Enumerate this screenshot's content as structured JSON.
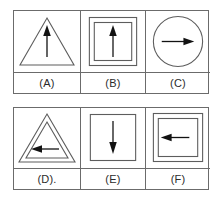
{
  "figure": {
    "title": "",
    "colors": {
      "background": "#ffffff",
      "outline": "#5d5d5d",
      "panel_border": "#6b6b6b",
      "arrow": "#121212",
      "label_text": "#2b2b2b"
    },
    "rows": [
      {
        "row_name": "top-row",
        "cells": [
          {
            "label": "(A)",
            "shape": "triangle",
            "shape_count": 1,
            "arrow_direction": "up",
            "arrow_name": "up-arrow-icon"
          },
          {
            "label": "(B)",
            "shape": "square",
            "shape_count": 2,
            "arrow_direction": "up",
            "arrow_name": "up-arrow-icon"
          },
          {
            "label": "(C)",
            "shape": "circle",
            "shape_count": 1,
            "arrow_direction": "right",
            "arrow_name": "right-arrow-icon"
          }
        ]
      },
      {
        "row_name": "bottom-row",
        "cells": [
          {
            "label": "(D).",
            "shape": "triangle",
            "shape_count": 2,
            "arrow_direction": "left",
            "arrow_name": "left-arrow-icon"
          },
          {
            "label": "(E)",
            "shape": "square",
            "shape_count": 1,
            "arrow_direction": "down",
            "arrow_name": "down-arrow-icon"
          },
          {
            "label": "(F)",
            "shape": "square",
            "shape_count": 2,
            "arrow_direction": "left",
            "arrow_name": "left-arrow-icon"
          }
        ]
      }
    ]
  }
}
